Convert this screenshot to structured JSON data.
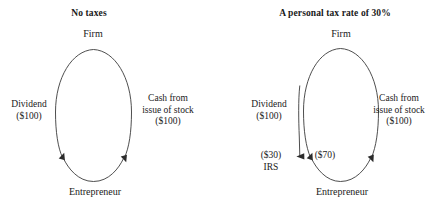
{
  "diagram": {
    "panels": [
      {
        "id": "no-taxes",
        "title": "No taxes",
        "top_node": "Firm",
        "bottom_node": "Entrepreneur",
        "left_edge": {
          "label": "Dividend",
          "amount": "($100)"
        },
        "right_edge": {
          "label": "Cash from\nissue of stock",
          "line1": "Cash from",
          "line2": "issue of stock",
          "amount": "($100)"
        }
      },
      {
        "id": "personal-tax-30",
        "title": "A personal tax rate of 30%",
        "top_node": "Firm",
        "bottom_node": "Entrepreneur",
        "left_edge": {
          "label": "Dividend",
          "amount": "($100)"
        },
        "right_edge": {
          "line1": "Cash from",
          "line2": "issue of stock",
          "amount": "($100)"
        },
        "tax_branch": {
          "amount": "($30)",
          "recipient": "IRS"
        },
        "net_branch": {
          "amount": "($70)"
        }
      }
    ],
    "colors": {
      "line": "#3a3a3a",
      "text": "#1a1a1a",
      "background": "#ffffff"
    }
  }
}
